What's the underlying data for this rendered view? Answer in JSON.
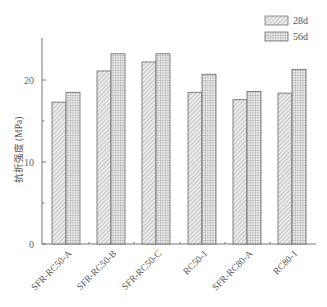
{
  "chart_data": {
    "type": "bar",
    "title": "",
    "xlabel": "",
    "ylabel": "抗折强度 (MPa)",
    "ylim": [
      0,
      25
    ],
    "yticks": [
      0,
      10,
      20
    ],
    "minor_yticks": [
      5,
      15
    ],
    "grid": false,
    "legend_position": "top-right",
    "categories": [
      "SFR-RC50-A",
      "SFR-RC50-B",
      "SFR-RC50-C",
      "RC50-1",
      "SFR-RC80-A",
      "RC80-1"
    ],
    "series": [
      {
        "name": "28d",
        "pattern": "diagonal-hatch",
        "values": [
          17.3,
          21.1,
          22.2,
          18.5,
          17.6,
          18.4
        ]
      },
      {
        "name": "56d",
        "pattern": "grid-hatch",
        "values": [
          18.5,
          23.2,
          23.2,
          20.7,
          18.6,
          21.3
        ]
      }
    ]
  },
  "legend": {
    "items": [
      {
        "label": "28d"
      },
      {
        "label": "56d"
      }
    ]
  },
  "colors": {
    "axis": "#777777",
    "bar_outline": "#666666",
    "hatch": "#9a9a9a",
    "fill": "#e8e8e8"
  }
}
